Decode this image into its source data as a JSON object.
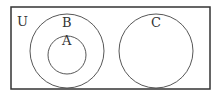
{
  "diagram": {
    "type": "venn",
    "universe_label": "U",
    "sets": [
      {
        "label": "B",
        "contains": [
          "A"
        ]
      },
      {
        "label": "A",
        "subset_of": "B"
      },
      {
        "label": "C",
        "disjoint_from": [
          "A",
          "B"
        ]
      }
    ],
    "colors": {
      "stroke": "#333333",
      "background": "#ffffff"
    }
  }
}
